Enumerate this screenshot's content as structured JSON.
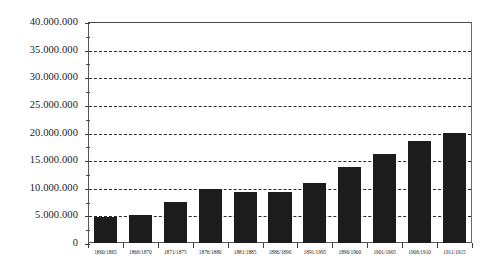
{
  "chart_data": {
    "type": "bar",
    "title": "",
    "subtitle": "",
    "xlabel": "",
    "ylabel": "",
    "categories": [
      "1860/1865",
      "1866/1870",
      "1871/1875",
      "1876/1880",
      "1881/1885",
      "1886/1890",
      "1891/1995",
      "1896/1900",
      "1901/1905",
      "1906/1910",
      "1911/1915"
    ],
    "values": [
      4700000,
      5000000,
      7400000,
      9700000,
      9200000,
      9300000,
      10900000,
      13700000,
      16100000,
      18400000,
      19900000
    ],
    "ylim": [
      0,
      40000000
    ],
    "ytick_values": [
      0,
      5000000,
      10000000,
      15000000,
      20000000,
      25000000,
      30000000,
      35000000,
      40000000
    ],
    "ytick_labels": [
      "0",
      "5.000.000",
      "10.000.000",
      "15.000.000",
      "20.000.000",
      "25.000.000",
      "30.000.000",
      "35.000.000",
      "40.000.000"
    ],
    "minor_tick_values": [
      2500000,
      7500000,
      12500000,
      17500000,
      22500000,
      27500000,
      32500000,
      37500000
    ],
    "grid": true,
    "grid_style": "dashed",
    "grid_axis": "y",
    "legend": null,
    "legend_position": "none",
    "bar_color": "#1c1c1c",
    "axis_color": "#3f3f3f",
    "grid_color": "#2b2b2b",
    "background_color": "#ffffff",
    "annotations": []
  }
}
